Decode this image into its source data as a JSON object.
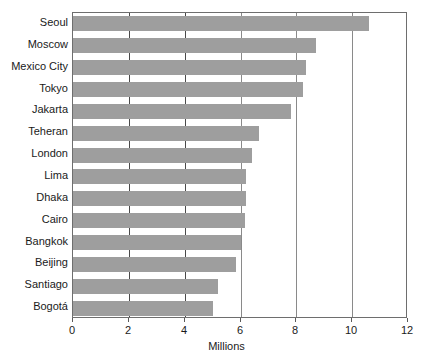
{
  "chart_data": {
    "type": "bar",
    "orientation": "horizontal",
    "title": "",
    "subtitle": "",
    "xlabel": "Millions",
    "ylabel": "",
    "xlim": [
      0,
      12
    ],
    "ylim": null,
    "xticks": [
      0,
      2,
      4,
      6,
      8,
      10,
      12
    ],
    "xtick_labels": [
      "0",
      "2",
      "4",
      "6",
      "8",
      "10",
      "12"
    ],
    "grid": "vertical",
    "legend": null,
    "legend_position": "none",
    "bar_color": "#9e9e9e",
    "categories": [
      "Seoul",
      "Moscow",
      "Mexico City",
      "Tokyo",
      "Jakarta",
      "Teheran",
      "London",
      "Lima",
      "Dhaka",
      "Cairo",
      "Bangkok",
      "Beijing",
      "Santiago",
      "Bogotá"
    ],
    "values": [
      10.6,
      8.7,
      8.35,
      8.25,
      7.8,
      6.65,
      6.4,
      6.2,
      6.2,
      6.15,
      6.0,
      5.85,
      5.2,
      5.0
    ]
  }
}
